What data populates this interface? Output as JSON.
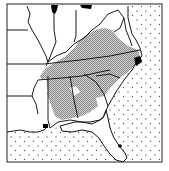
{
  "map": {
    "type": "species distribution range map",
    "region": "Southeastern United States",
    "colors": {
      "land": "#ffffff",
      "range_fill": "#b9b9b9",
      "border": "#1a1a1a",
      "water_dots": "#555555",
      "disjunct": "#000000"
    },
    "legend": {
      "range": "stippled gray = distribution range",
      "disjunct": "solid black = isolated populations",
      "ocean": "dotted = ocean / Gulf of Mexico"
    }
  }
}
